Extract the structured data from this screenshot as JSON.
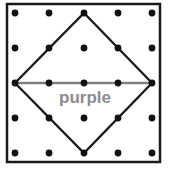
{
  "figure": {
    "background_color": "#ffffff",
    "width": 170,
    "height": 178
  },
  "frame": {
    "name": "board-frame",
    "x": 7,
    "y": 4,
    "width": 153,
    "height": 158,
    "stroke_color": "#1a1a1a",
    "stroke_width": 2.5,
    "fill_color": "#ffffff"
  },
  "pegs": {
    "name": "peg-grid",
    "rows": 5,
    "columns": 5,
    "radius": 3.4,
    "color": "#111111",
    "x_positions": [
      15,
      49,
      84,
      118,
      152
    ],
    "y_positions": [
      13,
      48,
      83,
      118,
      153
    ]
  },
  "diamond": {
    "name": "diamond-outline",
    "stroke_color": "#1a1a1a",
    "stroke_width": 2.3,
    "fill": "none",
    "vertices": [
      {
        "label": "top",
        "x": 84,
        "y": 13
      },
      {
        "label": "right",
        "x": 152,
        "y": 83
      },
      {
        "label": "bottom",
        "x": 84,
        "y": 153
      },
      {
        "label": "left",
        "x": 15,
        "y": 83
      }
    ]
  },
  "diagonal": {
    "name": "horizontal-diagonal",
    "stroke_color": "#7f7f7f",
    "stroke_width": 2.6,
    "x1": 15,
    "y1": 83,
    "x2": 152,
    "y2": 83
  },
  "label": {
    "name": "purple-label",
    "text": "purple",
    "color": "#8c8c8c",
    "font_size": 17,
    "x": 85,
    "y": 103
  }
}
